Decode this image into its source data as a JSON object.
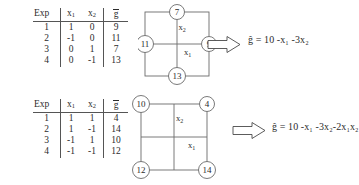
{
  "document": {
    "title": "Two-level experimental design tables with cube plots and fitted models"
  },
  "panels": [
    {
      "id": "face-centered-design",
      "table": {
        "headers": [
          "Exp",
          "x1",
          "x2",
          "gbar"
        ],
        "header_display": {
          "exp": "Exp",
          "x1": "x",
          "x1_sub": "1",
          "x2": "x",
          "x2_sub": "2",
          "g": "g"
        },
        "rows": [
          {
            "exp": "1",
            "x1": "1",
            "x2": "0",
            "g": "9"
          },
          {
            "exp": "2",
            "x1": "-1",
            "x2": "0",
            "g": "11"
          },
          {
            "exp": "3",
            "x1": "0",
            "x2": "1",
            "g": "7"
          },
          {
            "exp": "4",
            "x1": "0",
            "x2": "-1",
            "g": "13"
          }
        ]
      },
      "diagram": {
        "type": "star-design",
        "node_positions": [
          "top",
          "left",
          "right",
          "bottom"
        ],
        "nodes": [
          {
            "position": "top",
            "value": "7"
          },
          {
            "position": "left",
            "value": "11"
          },
          {
            "position": "right",
            "value": "9"
          },
          {
            "position": "bottom",
            "value": "13"
          }
        ],
        "axis_labels": {
          "x1": "x",
          "x1_sub": "1",
          "x2": "x",
          "x2_sub": "2"
        }
      },
      "arrow": {
        "icon": "block-arrow-right-icon",
        "direction": "right"
      },
      "equation": {
        "lhs": "g",
        "text": "ĝ = 10 -x₁ -3x₂",
        "terms": [
          "10",
          "-x1",
          "-3x2"
        ],
        "intercept": 10,
        "coefficients": {
          "x1": -1,
          "x2": -3
        }
      }
    },
    {
      "id": "full-factorial-design",
      "table": {
        "headers": [
          "Exp",
          "x1",
          "x2",
          "gbar"
        ],
        "header_display": {
          "exp": "Exp",
          "x1": "x",
          "x1_sub": "1",
          "x2": "x",
          "x2_sub": "2",
          "g": "g"
        },
        "rows": [
          {
            "exp": "1",
            "x1": "1",
            "x2": "1",
            "g": "4"
          },
          {
            "exp": "2",
            "x1": "1",
            "x2": "-1",
            "g": "14"
          },
          {
            "exp": "3",
            "x1": "-1",
            "x2": "1",
            "g": "10"
          },
          {
            "exp": "4",
            "x1": "-1",
            "x2": "-1",
            "g": "12"
          }
        ]
      },
      "diagram": {
        "type": "square-corners-design",
        "node_positions": [
          "top-left",
          "top-right",
          "bottom-left",
          "bottom-right"
        ],
        "nodes": [
          {
            "position": "top-left",
            "value": "10"
          },
          {
            "position": "top-right",
            "value": "4"
          },
          {
            "position": "bottom-left",
            "value": "12"
          },
          {
            "position": "bottom-right",
            "value": "14"
          }
        ],
        "axis_labels": {
          "x1": "x",
          "x1_sub": "1",
          "x2": "x",
          "x2_sub": "2"
        }
      },
      "arrow": {
        "icon": "block-arrow-right-icon",
        "direction": "right"
      },
      "equation": {
        "lhs": "g",
        "text": "ĝ = 10 -x₁ -3x₂-2x₁x₂",
        "terms": [
          "10",
          "-x1",
          "-3x2",
          "-2x1x2"
        ],
        "intercept": 10,
        "coefficients": {
          "x1": -1,
          "x2": -3,
          "x1x2": -2
        }
      }
    }
  ],
  "colors": {
    "ink": "#2b2b2b",
    "rule": "#555555",
    "diagram_stroke": "#6b6b6b",
    "background": "#ffffff"
  }
}
